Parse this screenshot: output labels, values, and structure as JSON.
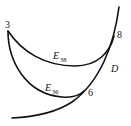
{
  "diagram": {
    "points": [
      {
        "id": "3",
        "label": "3"
      },
      {
        "id": "8",
        "label": "8"
      },
      {
        "id": "6",
        "label": "6"
      }
    ],
    "curves": {
      "D": {
        "label": "D"
      },
      "E38": {
        "label_main": "E",
        "label_sub": "38"
      },
      "E36": {
        "label_main": "E",
        "label_sub": "36"
      }
    },
    "colors": {
      "stroke": "#111111",
      "background": "#ffffff"
    }
  }
}
